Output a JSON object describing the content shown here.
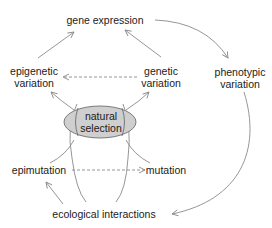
{
  "nodes": {
    "gene_expression": "gene expression",
    "epigenetic_variation": [
      "epigenetic",
      "variation"
    ],
    "genetic_variation": [
      "genetic",
      "variation"
    ],
    "phenotypic_variation": [
      "phenotypic",
      "variation"
    ],
    "natural_selection": [
      "natural",
      "selection"
    ],
    "epimutation": "epimutation",
    "mutation": "mutation",
    "ecological_interactions": "ecological interactions"
  },
  "colors": {
    "line": "#8a8a8a",
    "ellipse_fill": "#cfcfcf",
    "ellipse_stroke": "#6e6e6e",
    "text": "#1a1a1a"
  }
}
